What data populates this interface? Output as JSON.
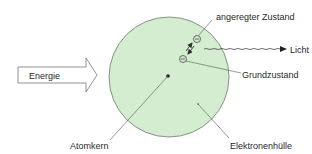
{
  "diagram": {
    "labels": {
      "excited_state": "angeregter Zustand",
      "light": "Licht",
      "ground_state": "Grundzustand",
      "energy": "Energie",
      "nucleus": "Atomkern",
      "electron_shell": "Elektronenhülle"
    },
    "colors": {
      "shell_fill": "#d4ecd0",
      "shell_stroke": "#6c7d6a",
      "line": "#555555",
      "text": "#2a2a2a"
    }
  }
}
